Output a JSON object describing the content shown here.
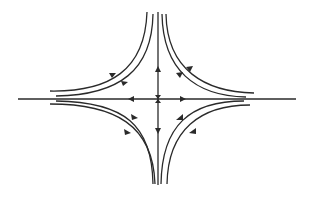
{
  "diagram": {
    "type": "phase-portrait",
    "colors": {
      "stroke": "#2a2a2a",
      "background": "#ffffff"
    },
    "axes": {
      "horizontal": {
        "arrows": [
          "left-of-center pointing left",
          "right-of-center pointing right"
        ]
      },
      "vertical": {
        "arrows": [
          "above-center pointing up",
          "below-center pointing down"
        ]
      }
    },
    "trajectories": {
      "upper_left": {
        "count": 2,
        "direction": "toward origin then up"
      },
      "upper_right": {
        "count": 2,
        "direction": "toward origin then up"
      },
      "lower_left": {
        "count": 2,
        "direction": "toward origin then down"
      },
      "lower_right": {
        "count": 2,
        "direction": "toward origin then down"
      }
    }
  }
}
